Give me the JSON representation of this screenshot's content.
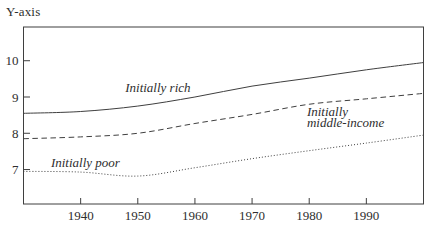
{
  "figure": {
    "background_color": "#ffffff",
    "line_color": "#3f3f3f",
    "text_color": "#2e2e2e"
  },
  "chart_data": {
    "type": "line",
    "title": "",
    "xlabel": "",
    "ylabel": "Y-axis",
    "x": [
      1930,
      1940,
      1950,
      1960,
      1970,
      1980,
      1990,
      2000
    ],
    "x_ticks": [
      1940,
      1950,
      1960,
      1970,
      1980,
      1990
    ],
    "y_ticks": [
      7,
      8,
      9,
      10
    ],
    "xlim": [
      1930,
      2000
    ],
    "ylim": [
      6.05,
      10.93
    ],
    "grid": false,
    "legend": "inline-annotations",
    "frame": "full-box",
    "series": [
      {
        "name": "Initially rich",
        "line_style": "solid",
        "values": [
          8.55,
          8.6,
          8.75,
          9.0,
          9.3,
          9.52,
          9.75,
          9.95
        ]
      },
      {
        "name": "Initially middle-income",
        "line_style": "dashed",
        "values": [
          7.85,
          7.9,
          8.0,
          8.27,
          8.52,
          8.8,
          8.95,
          9.1
        ]
      },
      {
        "name": "Initially poor",
        "line_style": "dotted",
        "values": [
          6.95,
          6.93,
          6.82,
          7.05,
          7.3,
          7.52,
          7.73,
          7.95
        ]
      }
    ],
    "annotations": [
      {
        "text": "Initially rich",
        "year": 1947.8,
        "value": 9.14
      },
      {
        "text": "Initially\nmiddle-income",
        "year": 1979.6,
        "value": 8.48
      },
      {
        "text": "Initially poor",
        "year": 1934.8,
        "value": 7.07
      }
    ]
  }
}
